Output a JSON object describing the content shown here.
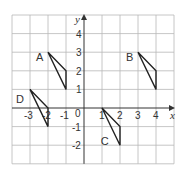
{
  "diagram": {
    "type": "coordinate-grid",
    "x_axis": {
      "label": "x",
      "min": -4,
      "max": 5,
      "tick_labels": [
        "-3",
        "-2",
        "-1",
        "1",
        "2",
        "3",
        "4"
      ],
      "tick_values": [
        -3,
        -2,
        -1,
        1,
        2,
        3,
        4
      ]
    },
    "y_axis": {
      "label": "y",
      "min": -3,
      "max": 5,
      "tick_labels": [
        "4",
        "3",
        "2",
        "1",
        "-1",
        "-2"
      ],
      "tick_values": [
        4,
        3,
        2,
        1,
        -1,
        -2
      ]
    },
    "origin_label": "0",
    "colors": {
      "grid": "#b8b8b8",
      "axis": "#333333",
      "shape": "#222222"
    },
    "shapes": [
      {
        "label": "A",
        "vertices": [
          [
            -2,
            3
          ],
          [
            -1,
            2
          ],
          [
            -1,
            1
          ]
        ],
        "label_pos": [
          -2.45,
          2.75
        ]
      },
      {
        "label": "B",
        "vertices": [
          [
            3,
            3
          ],
          [
            4,
            2
          ],
          [
            4,
            1
          ]
        ],
        "label_pos": [
          2.55,
          2.75
        ]
      },
      {
        "label": "C",
        "vertices": [
          [
            1,
            0
          ],
          [
            2,
            -1
          ],
          [
            2,
            -2
          ]
        ],
        "label_pos": [
          1.15,
          -1.75
        ]
      },
      {
        "label": "D",
        "vertices": [
          [
            -3,
            1
          ],
          [
            -2,
            0
          ],
          [
            -2,
            -1
          ]
        ],
        "label_pos": [
          -3.55,
          0.5
        ]
      }
    ]
  }
}
